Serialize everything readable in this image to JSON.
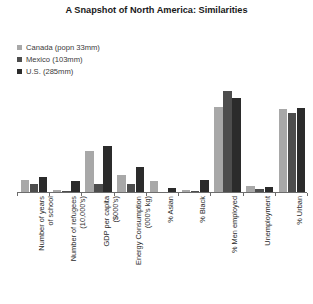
{
  "chart_data": {
    "type": "bar",
    "title": "A Snapshot of North America: Similarities",
    "xlabel": "",
    "ylabel": "",
    "grid": false,
    "legend_position": "top-left",
    "ylim": [
      0,
      100
    ],
    "categories": [
      "Number of years\nof school",
      "Number of refugees\n(10,000's)",
      "GDP per capita\n($000's)",
      "Energy Consumption\n(000's kg)",
      "% Asian",
      "% Black",
      "% Men employed",
      "Unemployment",
      "% Urban"
    ],
    "series": [
      {
        "name": "Canada (popn 33mm)",
        "color": "#a8a8a8",
        "values": [
          12,
          2,
          39,
          16,
          11,
          2,
          82,
          6,
          80
        ]
      },
      {
        "name": "Mexico (103mm)",
        "color": "#4d4d4d",
        "values": [
          8,
          1,
          8,
          8,
          0,
          1,
          97,
          3,
          76
        ]
      },
      {
        "name": "U.S. (285mm)",
        "color": "#2b2b2b",
        "values": [
          14,
          11,
          44,
          24,
          4,
          12,
          90,
          5,
          81
        ]
      }
    ]
  },
  "legend": {
    "items": [
      {
        "label": "Canada (popn 33mm)",
        "color": "#a8a8a8"
      },
      {
        "label": "Mexico (103mm)",
        "color": "#4d4d4d"
      },
      {
        "label": "U.S. (285mm)",
        "color": "#2b2b2b"
      }
    ]
  },
  "colors": {
    "background": "#ffffff",
    "axis": "#6d6d6d",
    "text": "#231f20"
  }
}
